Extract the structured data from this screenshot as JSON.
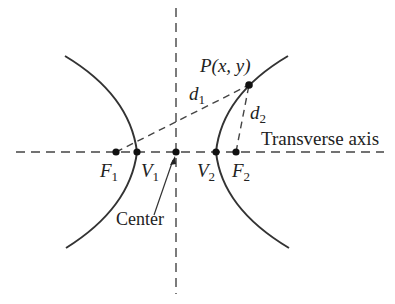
{
  "diagram": {
    "type": "hyperbola",
    "labels": {
      "point": "P(x, y)",
      "point_name": "P",
      "point_coords": "(x, y)",
      "d1": "d",
      "d1_sub": "1",
      "d2": "d",
      "d2_sub": "2",
      "transverse_axis": "Transverse axis",
      "center": "Center",
      "F1": "F",
      "F1_sub": "1",
      "V1": "V",
      "V1_sub": "1",
      "V2": "V",
      "V2_sub": "2",
      "F2": "F",
      "F2_sub": "2"
    },
    "points": [
      {
        "name": "F1",
        "x": 116,
        "y": 152
      },
      {
        "name": "V1",
        "x": 137,
        "y": 152
      },
      {
        "name": "Center",
        "x": 176,
        "y": 152
      },
      {
        "name": "V2",
        "x": 216,
        "y": 152
      },
      {
        "name": "F2",
        "x": 236,
        "y": 152
      },
      {
        "name": "P",
        "x": 249,
        "y": 85
      }
    ],
    "colors": {
      "curve": "#333333",
      "axis": "#444444",
      "point": "#111111",
      "text": "#222222"
    }
  }
}
